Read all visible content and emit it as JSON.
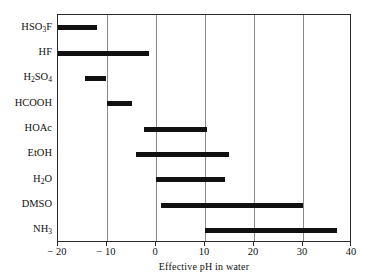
{
  "chart_data": {
    "type": "bar",
    "subtype": "range-bar",
    "title": "",
    "subtitle": "",
    "xlabel": "Effective pH in water",
    "ylabel": "",
    "xlim": [
      -20,
      40
    ],
    "ylim": [
      0,
      9
    ],
    "grid": "vertical-only",
    "legend": "none",
    "xticks": [
      -20,
      -10,
      0,
      10,
      20,
      30,
      40
    ],
    "xtick_labels": [
      "− 20",
      "− 10",
      "0",
      "10",
      "20",
      "30",
      "40"
    ],
    "gridline_values": [
      -10,
      0,
      10,
      20,
      30
    ],
    "categories": [
      "HSO3F",
      "HF",
      "H2SO4",
      "HCOOH",
      "HOAc",
      "EtOH",
      "H2O",
      "DMSO",
      "NH3"
    ],
    "category_labels": [
      "HSO<sub>3</sub>F",
      "HF",
      "H<sub>2</sub>SO<sub>4</sub>",
      "HCOOH",
      "HOAc",
      "EtOH",
      "H<sub>2</sub>O",
      "DMSO",
      "NH<sub>3</sub>"
    ],
    "series": [
      {
        "name": "Effective pH range",
        "ranges": [
          {
            "category": "HSO3F",
            "start": -20.0,
            "end": -12.0
          },
          {
            "category": "HF",
            "start": -20.0,
            "end": -1.5
          },
          {
            "category": "H2SO4",
            "start": -14.5,
            "end": -10.2
          },
          {
            "category": "HCOOH",
            "start": -10.0,
            "end": -5.0
          },
          {
            "category": "HOAc",
            "start": -2.5,
            "end": 10.5
          },
          {
            "category": "EtOH",
            "start": -4.0,
            "end": 15.0
          },
          {
            "category": "H2O",
            "start": 0.0,
            "end": 14.0
          },
          {
            "category": "DMSO",
            "start": 1.0,
            "end": 30.0
          },
          {
            "category": "NH3",
            "start": 10.0,
            "end": 37.0
          }
        ]
      }
    ],
    "bar_color": "#111111",
    "grid_color": "#8a8a8a",
    "axis_color": "#2b2b2b",
    "background_color": "#ffffff"
  }
}
